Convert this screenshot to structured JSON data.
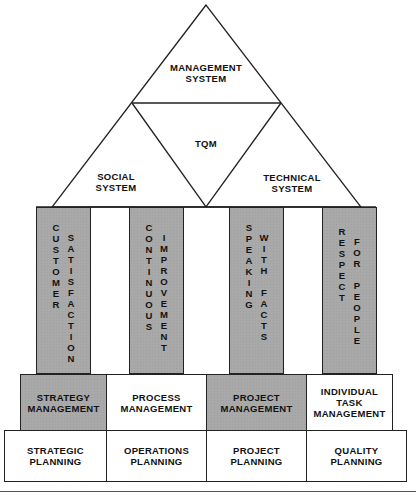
{
  "diagram": {
    "type": "house-of-quality-management",
    "roof": {
      "top_triangle": "MANAGEMENT\nSYSTEM",
      "center_triangle": "TQM",
      "left_triangle": "SOCIAL\nSYSTEM",
      "right_triangle": "TECHNICAL\nSYSTEM"
    },
    "pillars": [
      {
        "words": [
          "CUSTOMER",
          "SATISFACTION"
        ]
      },
      {
        "words": [
          "CONTINUOUS",
          "IMPROVEMENT"
        ]
      },
      {
        "words": [
          "SPEAKING",
          "WITH FACTS"
        ]
      },
      {
        "words": [
          "RESPECT",
          "FOR PEOPLE"
        ]
      }
    ],
    "management_row": [
      {
        "label": "STRATEGY\nMANAGEMENT",
        "shaded": true
      },
      {
        "label": "PROCESS\nMANAGEMENT",
        "shaded": false
      },
      {
        "label": "PROJECT\nMANAGEMENT",
        "shaded": true
      },
      {
        "label": "INDIVIDUAL\nTASK\nMANAGEMENT",
        "shaded": false
      }
    ],
    "planning_row": [
      {
        "label": "STRATEGIC\nPLANNING"
      },
      {
        "label": "OPERATIONS\nPLANNING"
      },
      {
        "label": "PROJECT\nPLANNING"
      },
      {
        "label": "QUALITY\nPLANNING"
      }
    ],
    "colors": {
      "pillar_fill": "#a9a9a9",
      "line": "#222222",
      "background": "#ffffff"
    }
  }
}
